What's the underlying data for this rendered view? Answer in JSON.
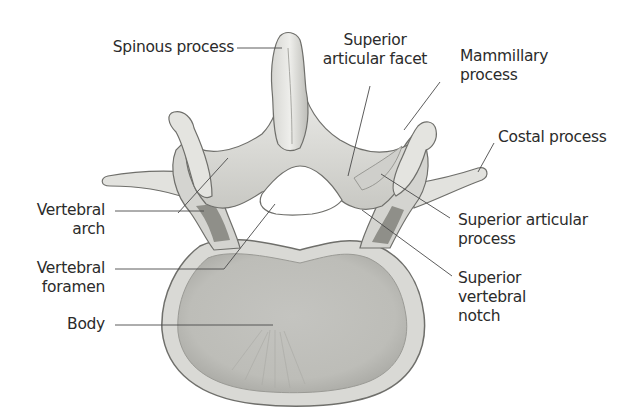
{
  "figure": {
    "colors": {
      "background": "#ffffff",
      "bone_light": "#e6e6e3",
      "bone_mid": "#c9c9c5",
      "bone_dark": "#6f6f6b",
      "leader_line": "#4a4a4a",
      "text": "#2b2b2b"
    },
    "labels": [
      {
        "id": "spinous-process",
        "line1": "Spinous process",
        "line2": "",
        "line3": ""
      },
      {
        "id": "superior-articular-facet",
        "line1": "Superior",
        "line2": "articular facet",
        "line3": ""
      },
      {
        "id": "mammillary-process",
        "line1": "Mammillary",
        "line2": "process",
        "line3": ""
      },
      {
        "id": "costal-process",
        "line1": "Costal process",
        "line2": "",
        "line3": ""
      },
      {
        "id": "vertebral-arch",
        "line1": "Vertebral",
        "line2": "arch",
        "line3": ""
      },
      {
        "id": "vertebral-foramen",
        "line1": "Vertebral",
        "line2": "foramen",
        "line3": ""
      },
      {
        "id": "body",
        "line1": "Body",
        "line2": "",
        "line3": ""
      },
      {
        "id": "superior-articular-process",
        "line1": "Superior articular",
        "line2": "process",
        "line3": ""
      },
      {
        "id": "superior-vertebral-notch",
        "line1": "Superior",
        "line2": "vertebral",
        "line3": "notch"
      }
    ]
  }
}
